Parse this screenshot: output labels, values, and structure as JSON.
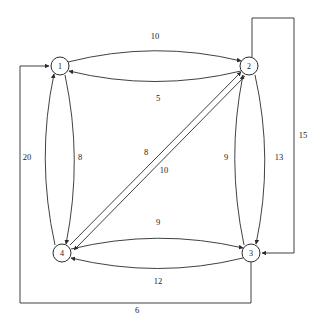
{
  "diagram": {
    "type": "directed-weighted-graph",
    "title": "",
    "stroke_color": "#2b2b2b",
    "node_fill": "#ffffff",
    "background": "#ffffff",
    "nodes": [
      {
        "id": "1",
        "label": "1",
        "cx": 60,
        "cy": 66,
        "r": 9
      },
      {
        "id": "2",
        "label": "2",
        "cx": 249,
        "cy": 66,
        "r": 9
      },
      {
        "id": "3",
        "label": "3",
        "cx": 251,
        "cy": 253,
        "r": 9
      },
      {
        "id": "4",
        "label": "4",
        "cx": 62,
        "cy": 253,
        "r": 9
      }
    ],
    "edges": [
      {
        "from": "1",
        "to": "2",
        "weight": "10",
        "shape": "arc-top",
        "lx": 155,
        "ly": 36
      },
      {
        "from": "2",
        "to": "1",
        "weight": "5",
        "shape": "arc-bottom",
        "lx": 158,
        "ly": 98
      },
      {
        "from": "4",
        "to": "1",
        "weight": "20",
        "shape": "arc-left",
        "lx": 27,
        "ly": 157
      },
      {
        "from": "1",
        "to": "4",
        "weight": "8",
        "shape": "arc-right",
        "lx": 80,
        "ly": 157
      },
      {
        "from": "4",
        "to": "2",
        "weight": "8",
        "shape": "diagonal-up",
        "lx": 146,
        "ly": 152
      },
      {
        "from": "2",
        "to": "4",
        "weight": "10",
        "shape": "diagonal-dn",
        "lx": 164,
        "ly": 170
      },
      {
        "from": "3",
        "to": "2",
        "weight": "9",
        "shape": "arc-inner",
        "lx": 226,
        "ly": 157
      },
      {
        "from": "2",
        "to": "3",
        "weight": "13",
        "shape": "arc-outer",
        "lx": 279,
        "ly": 157
      },
      {
        "from": "4",
        "to": "3",
        "weight": "9",
        "shape": "arc-top",
        "lx": 158,
        "ly": 222
      },
      {
        "from": "3",
        "to": "4",
        "weight": "12",
        "shape": "arc-bottom",
        "lx": 158,
        "ly": 281
      },
      {
        "from": "2",
        "to": "3",
        "weight": "15",
        "shape": "rect-right",
        "lx": 303,
        "ly": 135
      },
      {
        "from": "3",
        "to": "1",
        "weight": "6",
        "shape": "rect-bottom",
        "lx": 137,
        "ly": 310
      }
    ],
    "labels": {
      "n1": "1",
      "n2": "2",
      "n3": "3",
      "n4": "4",
      "e_1_2": "10",
      "e_2_1": "5",
      "e_4_1": "20",
      "e_1_4": "8",
      "e_4_2": "8",
      "e_2_4": "10",
      "e_3_2": "9",
      "e_2_3": "13",
      "e_4_3": "9",
      "e_3_4": "12",
      "e_2_3_outer": "15",
      "e_3_1_outer": "6"
    }
  }
}
